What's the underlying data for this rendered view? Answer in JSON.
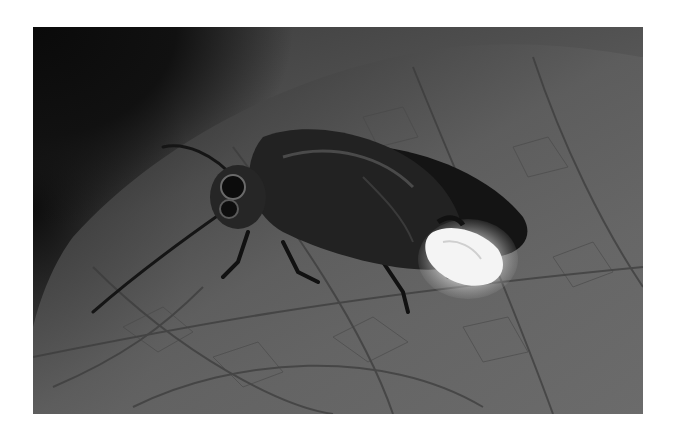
{
  "image": {
    "subject": "firefly on leaf",
    "style": "grayscale photograph",
    "colors": {
      "background": "#ffffff",
      "dark_corner": "#0a0a0a",
      "leaf_mid": "#5a5a5a",
      "leaf_light": "#7a7a7a",
      "insect_body": "#1a1a1a",
      "glow": "#f2f2f2"
    }
  }
}
